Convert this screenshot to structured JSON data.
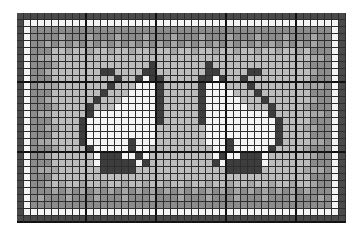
{
  "pattern": {
    "title": "Two cats chart",
    "columns": 47,
    "rows": 30,
    "cell_px": 7,
    "major_grid_every": 10,
    "colors": {
      "D": "#3d3d3d",
      "W": "#f4f4f4",
      ".": "#bcbcbc",
      "G": "#8c8c8c",
      "L": "#a6a6a6",
      "B": "#4a4a4a"
    },
    "frame": {
      "outer_color_key": "B",
      "inner_line_color_key": "W",
      "band_color_key": "G",
      "band_dot_color_key": "L"
    },
    "left_cat": {
      "start_col": 9,
      "start_row": 7,
      "mirror_axis_col": 23,
      "rows": [
        "..........D...",
        "...DD....DD...",
        ".....D..DWDD..",
        "....D...WWWD..",
        "...D...WWWWD..",
        "..D...WWWWWD..",
        ".D...WWWWWWD..",
        ".DWWWWWWWWWD..",
        "DWWWWWWWWWWD..",
        "DWWWWWWWWWW...",
        "DWWWWWWWWWW...",
        "DWWWWWWDWWW...",
        ".DWWWWWDWW....",
        "..WDDDWWDW....",
        "..WDDDDDWD....",
        "...DDDDD......"
      ]
    }
  }
}
